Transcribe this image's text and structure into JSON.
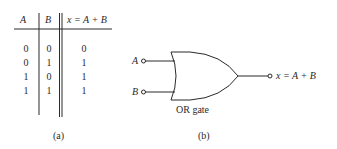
{
  "truth_table": {
    "headers": [
      "A",
      "B",
      "x = A + B"
    ],
    "rows": [
      [
        "0",
        "0",
        "0"
      ],
      [
        "0",
        "1",
        "1"
      ],
      [
        "1",
        "0",
        "1"
      ],
      [
        "1",
        "1",
        "1"
      ]
    ],
    "caption": "(a)"
  },
  "gate_diagram": {
    "input_a": "A",
    "input_b": "B",
    "output": "x = A + B",
    "gate_label": "OR gate",
    "caption": "(b)"
  },
  "colors": {
    "ink": "#2a2a2a",
    "background": "#ffffff"
  }
}
